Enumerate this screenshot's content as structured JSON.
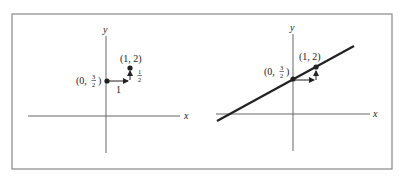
{
  "figure": {
    "left_panel": {
      "x_axis_label": "x",
      "y_axis_label": "y",
      "point_a_label_prefix": "(0, ",
      "point_a_num": "3",
      "point_a_den": "2",
      "point_a_label_suffix": ")",
      "point_b_label": "(1, 2)",
      "run_label": "1",
      "rise_num": "1",
      "rise_den": "2"
    },
    "right_panel": {
      "x_axis_label": "x",
      "y_axis_label": "y",
      "point_a_label_prefix": "(0, ",
      "point_a_num": "3",
      "point_a_den": "2",
      "point_a_label_suffix": ")",
      "point_b_label": "(1, 2)"
    },
    "colors": {
      "frame": "#888888",
      "axis": "#555555",
      "line": "#222222"
    }
  }
}
